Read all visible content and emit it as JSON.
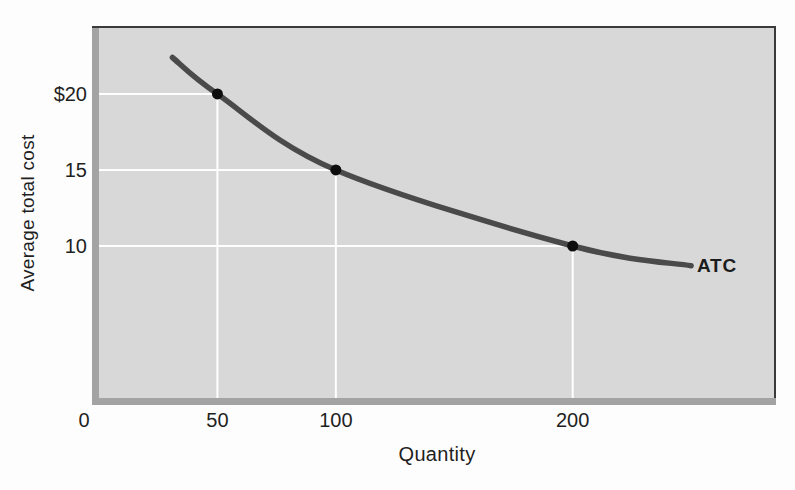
{
  "chart_data": {
    "type": "line",
    "title": "",
    "xlabel": "Quantity",
    "ylabel": "Average total cost",
    "curve_label": "ATC",
    "xlim": [
      0,
      285
    ],
    "ylim": [
      0,
      24.34
    ],
    "grid": "white droplines from each marked point to both axes",
    "legend": "inline bold label at right end of curve",
    "series": [
      {
        "name": "ATC",
        "x": [
          31,
          50,
          100,
          200,
          250
        ],
        "y": [
          22.4,
          20,
          15,
          10,
          8.7
        ]
      }
    ],
    "marked_points": [
      {
        "x": 50,
        "y": 20
      },
      {
        "x": 100,
        "y": 15
      },
      {
        "x": 200,
        "y": 10
      }
    ],
    "x_ticks": [
      {
        "value": 0,
        "label": "0",
        "dx": -15
      },
      {
        "value": 50,
        "label": "50",
        "dx": 0
      },
      {
        "value": 100,
        "label": "100",
        "dx": 0
      },
      {
        "value": 200,
        "label": "200",
        "dx": 0
      }
    ],
    "y_ticks": [
      {
        "value": 20,
        "label": "$20"
      },
      {
        "value": 15,
        "label": "15"
      },
      {
        "value": 10,
        "label": "10"
      }
    ],
    "colors": {
      "plot_background": "#d8d8d8",
      "frame_shadow": "#a3a3a3",
      "frame_line": "#3a3a3a",
      "curve": "#4a4a4a",
      "point": "#0d0d0d",
      "dropline": "#ffffff",
      "text": "#1f1f1f"
    }
  }
}
